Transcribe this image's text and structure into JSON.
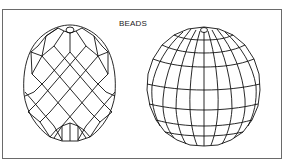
{
  "figure": {
    "title": "BEADS",
    "frame_color": "#6a6a6a",
    "line_color": "#111111",
    "background": "#ffffff"
  },
  "beads": [
    {
      "id": "faceted-oval-bead",
      "description": "Egg-shaped bead with diagonal diamond (lattice) facets and a top drill hole",
      "facet_pattern": "diamond-lattice"
    },
    {
      "id": "faceted-round-bead",
      "description": "Spherical bead with latitude/longitude grid facets and a top drill hole",
      "facet_pattern": "lat-long-grid"
    }
  ]
}
